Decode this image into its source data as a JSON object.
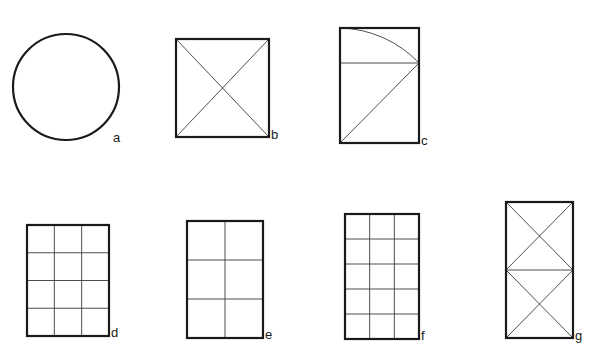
{
  "figures": [
    {
      "id": "a",
      "label": "a",
      "type": "circle",
      "cx": 66,
      "cy": 87,
      "r": 53,
      "label_pos": [
        113,
        131
      ]
    },
    {
      "id": "b",
      "label": "b",
      "type": "square-diagonals",
      "x": 176,
      "y": 39,
      "w": 93,
      "h": 98,
      "label_pos": [
        271,
        128
      ]
    },
    {
      "id": "c",
      "label": "c",
      "type": "root-rectangle-construction",
      "x": 340,
      "y": 28,
      "w": 79,
      "h": 115,
      "split_y": 63,
      "label_pos": [
        421,
        134
      ]
    },
    {
      "id": "d",
      "label": "d",
      "type": "grid",
      "x": 27,
      "y": 225,
      "w": 82,
      "h": 111,
      "cols": 3,
      "rows": 4,
      "label_pos": [
        111,
        326
      ]
    },
    {
      "id": "e",
      "label": "e",
      "type": "grid",
      "x": 187,
      "y": 221,
      "w": 76,
      "h": 117,
      "cols": 2,
      "rows": 3,
      "label_pos": [
        265,
        328
      ]
    },
    {
      "id": "f",
      "label": "f",
      "type": "grid",
      "x": 345,
      "y": 214,
      "w": 74,
      "h": 125,
      "cols": 3,
      "rows": 5,
      "label_pos": [
        421,
        329
      ]
    },
    {
      "id": "g",
      "label": "g",
      "type": "double-square-diagonals",
      "x": 506,
      "y": 202,
      "w": 67,
      "h": 136,
      "label_pos": [
        575,
        329
      ]
    }
  ],
  "colors": {
    "stroke": "#1a1a1a",
    "thin_stroke": "#3a3a3a",
    "background": "#ffffff"
  }
}
